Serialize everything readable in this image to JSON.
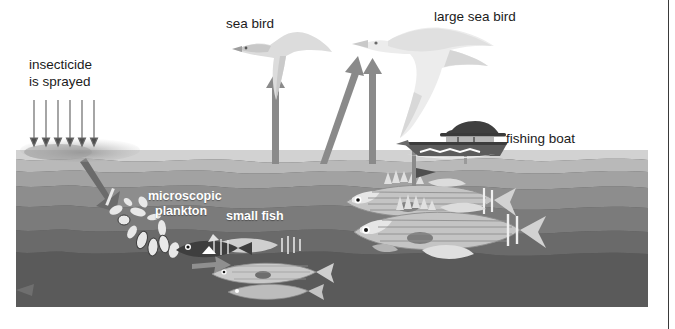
{
  "diagram": {
    "labels": {
      "insecticide_line1": "insecticide",
      "insecticide_line2": "is sprayed",
      "sea_bird": "sea bird",
      "large_sea_bird": "large sea bird",
      "fishing_boat": "fishing boat",
      "plankton_line1": "microscopic",
      "plankton_line2": "plankton",
      "small_fish": "small fish"
    },
    "colors": {
      "background": "#ffffff",
      "text_dark": "#1b1b1b",
      "text_light": "#ffffff",
      "arrow": "#8a8a8a",
      "arrow_dark": "#7c7c7c",
      "spray_line": "#6a6a6a",
      "water_surface": "#d2d2d2",
      "water_band_1": "#b9b9b9",
      "water_band_2": "#a2a2a2",
      "water_band_3": "#8d8d8d",
      "water_band_4": "#7b7b7b",
      "water_band_5": "#6a6a6a",
      "water_deep": "#5a5a5a",
      "bird_light": "#dcdcdc",
      "bird_pale": "#ececec",
      "boat_dark": "#4a4a4a",
      "plankton": "#e8e8e8",
      "fish_body": "#c9c9c9",
      "page_rule": "#3a3a3a"
    },
    "counts": {
      "spray_arrows": 6,
      "upward_arrows": 3,
      "large_fish": 2
    },
    "elements": [
      "insecticide-spray",
      "spray-haze",
      "descending-arrow-to-plankton",
      "microscopic-plankton",
      "small-fish-group",
      "large-striped-fish",
      "arrow-plankton-to-small-fish",
      "arrow-to-sea-bird",
      "arrow-to-large-sea-bird",
      "arrow-boat-to-large-sea-bird",
      "sea-bird",
      "large-sea-bird",
      "fishing-boat"
    ]
  }
}
